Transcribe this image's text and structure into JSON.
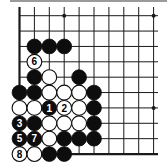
{
  "diagram": {
    "type": "go-board-fragment",
    "columns": 10,
    "rows": 10,
    "edges": {
      "left": true,
      "bottom": true,
      "top": false,
      "right": false
    },
    "colors": {
      "line": "#1a1a1a",
      "black_stone": "#0d0d0d",
      "white_stone": "#ffffff",
      "background": "#ffffff",
      "rule": "#9a9a9a"
    },
    "star_points": [
      {
        "col": 3,
        "row": 0
      },
      {
        "col": 9,
        "row": 0
      },
      {
        "col": 9,
        "row": 6
      }
    ],
    "stones": [
      {
        "col": 1,
        "row": 2,
        "color": "black",
        "label": ""
      },
      {
        "col": 2,
        "row": 2,
        "color": "black",
        "label": ""
      },
      {
        "col": 3,
        "row": 2,
        "color": "black",
        "label": ""
      },
      {
        "col": 1,
        "row": 3,
        "color": "white",
        "label": "6"
      },
      {
        "col": 1,
        "row": 4,
        "color": "black",
        "label": ""
      },
      {
        "col": 2,
        "row": 4,
        "color": "white",
        "label": ""
      },
      {
        "col": 4,
        "row": 4,
        "color": "black",
        "label": ""
      },
      {
        "col": 0,
        "row": 5,
        "color": "black",
        "label": ""
      },
      {
        "col": 1,
        "row": 5,
        "color": "black",
        "label": ""
      },
      {
        "col": 2,
        "row": 5,
        "color": "white",
        "label": ""
      },
      {
        "col": 3,
        "row": 5,
        "color": "white",
        "label": ""
      },
      {
        "col": 4,
        "row": 5,
        "color": "white",
        "label": ""
      },
      {
        "col": 5,
        "row": 5,
        "color": "black",
        "label": ""
      },
      {
        "col": 0,
        "row": 6,
        "color": "white",
        "label": ""
      },
      {
        "col": 1,
        "row": 6,
        "color": "white",
        "label": ""
      },
      {
        "col": 2,
        "row": 6,
        "color": "black",
        "label": "1"
      },
      {
        "col": 3,
        "row": 6,
        "color": "white",
        "label": "2"
      },
      {
        "col": 4,
        "row": 6,
        "color": "white",
        "label": ""
      },
      {
        "col": 5,
        "row": 6,
        "color": "black",
        "label": ""
      },
      {
        "col": 0,
        "row": 7,
        "color": "black",
        "label": "3"
      },
      {
        "col": 1,
        "row": 7,
        "color": "black",
        "label": ""
      },
      {
        "col": 2,
        "row": 7,
        "color": "white",
        "label": ""
      },
      {
        "col": 3,
        "row": 7,
        "color": "white",
        "label": ""
      },
      {
        "col": 4,
        "row": 7,
        "color": "white",
        "label": ""
      },
      {
        "col": 5,
        "row": 7,
        "color": "black",
        "label": ""
      },
      {
        "col": 0,
        "row": 8,
        "color": "black",
        "label": "5"
      },
      {
        "col": 1,
        "row": 8,
        "color": "black",
        "label": "7"
      },
      {
        "col": 2,
        "row": 8,
        "color": "white",
        "label": ""
      },
      {
        "col": 3,
        "row": 8,
        "color": "black",
        "label": ""
      },
      {
        "col": 4,
        "row": 8,
        "color": "black",
        "label": ""
      },
      {
        "col": 5,
        "row": 8,
        "color": "black",
        "label": ""
      },
      {
        "col": 0,
        "row": 9,
        "color": "white",
        "label": "8"
      },
      {
        "col": 1,
        "row": 9,
        "color": "white",
        "label": ""
      },
      {
        "col": 2,
        "row": 9,
        "color": "black",
        "label": ""
      },
      {
        "col": 3,
        "row": 9,
        "color": "black",
        "label": ""
      }
    ],
    "move_labels": [
      "1",
      "2",
      "3",
      "5",
      "6",
      "7",
      "8"
    ]
  }
}
